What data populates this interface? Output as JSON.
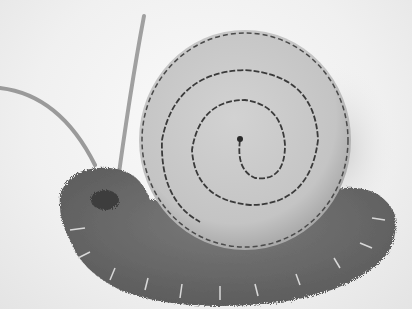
{
  "image": {
    "subject": "felt snail craft",
    "description": "Grayscale photo of a handmade felt snail with a round stitched spiral shell on a fuzzy scalloped body with two wire antennae",
    "colors": {
      "background": "#f2f2f2",
      "shell": "#c9c9c9",
      "shell_edge": "#a8a8a8",
      "spiral_stitch": "#3a3a3a",
      "body": "#6e6e6e",
      "body_dark": "#4a4a4a",
      "antenna": "#9a9a9a",
      "stitch_thread": "#d8d8d8"
    }
  }
}
